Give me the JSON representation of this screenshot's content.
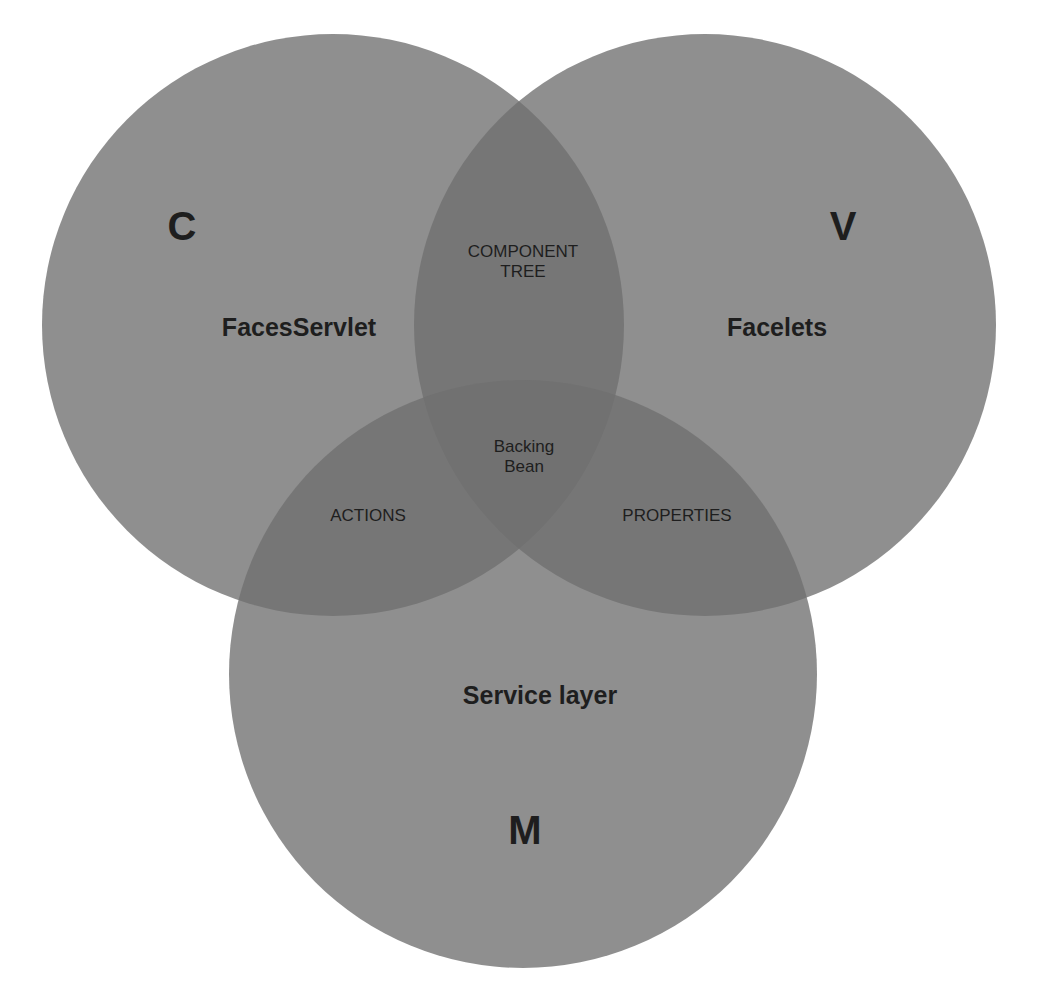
{
  "diagram": {
    "type": "venn",
    "colors": {
      "circle_fill": "#7a7a7a",
      "text": "#1e1e1e",
      "background": "#ffffff"
    },
    "circles": [
      {
        "id": "controller",
        "letter": "C",
        "label": "FacesServlet"
      },
      {
        "id": "view",
        "letter": "V",
        "label": "Facelets"
      },
      {
        "id": "model",
        "letter": "M",
        "label": "Service layer"
      }
    ],
    "overlaps": {
      "controller_view": [
        "COMPONENT",
        "TREE"
      ],
      "controller_model": "ACTIONS",
      "view_model": "PROPERTIES",
      "all": [
        "Backing",
        "Bean"
      ]
    }
  }
}
